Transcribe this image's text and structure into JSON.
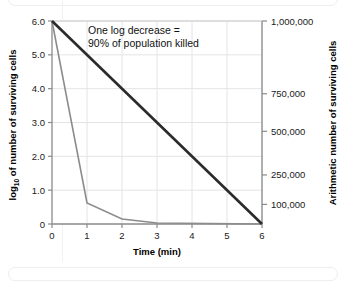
{
  "chart_data": {
    "type": "line",
    "title": "",
    "subtitle": "",
    "xlabel": "Time (min)",
    "ylabel": "log10 of number of surviving cells",
    "ylabel_prefix": "log",
    "ylabel_sub": "10",
    "ylabel_suffix": " of number of surviving cells",
    "ylabel_right": "Arithmetic number of surviving cells",
    "xlim": [
      0,
      6
    ],
    "ylim": [
      0,
      6
    ],
    "xticks": [
      "0",
      "1",
      "2",
      "3",
      "4",
      "5",
      "6"
    ],
    "xtick_values": [
      0,
      1,
      2,
      3,
      4,
      5,
      6
    ],
    "yticks": [
      "0",
      "1.0",
      "2.0",
      "3.0",
      "4.0",
      "5.0",
      "6.0"
    ],
    "ytick_values": [
      0,
      1,
      2,
      3,
      4,
      5,
      6
    ],
    "y2ticks": [
      "100,000",
      "250,000",
      "500,000",
      "750,000",
      "1,000,000"
    ],
    "y2tick_positions": [
      0.58,
      1.45,
      2.74,
      3.85,
      6.0
    ],
    "grid": true,
    "legend": "none",
    "annotations": [
      {
        "name": "one-log-decrease-note",
        "line1": "One log decrease =",
        "line2": "90% of population killed",
        "x": 1.35,
        "y": 5.45
      }
    ],
    "series": [
      {
        "name": "Linear log decline (straight line)",
        "color": "#2b2b2b",
        "width": 2.6,
        "x": [
          0,
          6
        ],
        "values": [
          6.0,
          0.0
        ]
      },
      {
        "name": "Rapid initial kill curve",
        "color": "#8c8c8c",
        "width": 1.6,
        "x": [
          0,
          1,
          2,
          3,
          6
        ],
        "values": [
          6.0,
          0.62,
          0.15,
          0.03,
          0.0
        ]
      }
    ]
  },
  "figure": {
    "background": "#ffffff",
    "grid_color": "#e3e4e6",
    "axis_color": "#8a8a8a",
    "text_color": "#111111"
  }
}
